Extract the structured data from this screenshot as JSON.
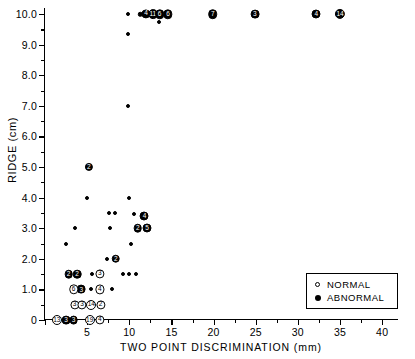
{
  "chart_data": {
    "type": "scatter",
    "title": "",
    "xlabel": "TWO POINT DISCRIMINATION  (mm)",
    "ylabel": "RIDGE (cm)",
    "xlim": [
      0,
      42
    ],
    "ylim": [
      0,
      10.2
    ],
    "grid": false,
    "legend_position": "lower-right",
    "x_ticks": [
      0,
      5,
      10,
      15,
      20,
      25,
      30,
      35,
      40
    ],
    "x_tick_labels": [
      "",
      "5",
      "10",
      "15",
      "20",
      "25",
      "30",
      "35",
      "40"
    ],
    "x_minor_ticks": [
      2.5,
      7.5,
      12.5,
      17.5,
      22.5,
      27.5,
      32.5,
      37.5
    ],
    "y_ticks": [
      0,
      1.0,
      2.0,
      3.0,
      4.0,
      5.0,
      6.0,
      7.0,
      8.0,
      9.0,
      10.0
    ],
    "y_tick_labels": [
      "0",
      "1.0",
      "2.0",
      "3.0",
      "4.0",
      "5.0",
      "6.0",
      "7.0",
      "8.0",
      "9.0",
      "10.0"
    ],
    "y_minor_ticks": [
      0.5,
      1.5,
      2.5,
      3.5,
      4.5,
      5.5,
      6.5,
      7.5,
      8.5,
      9.5
    ],
    "legend": [
      {
        "label": "NORMAL",
        "marker": "open-circle"
      },
      {
        "label": "ABNORMAL",
        "marker": "filled-circle"
      }
    ],
    "series": [
      {
        "name": "ABNORMAL",
        "marker": "filled-circle",
        "points": [
          {
            "x": 9.8,
            "y": 10.0,
            "n": 1,
            "r": 2.0
          },
          {
            "x": 9.8,
            "y": 9.35,
            "n": 1,
            "r": 2.0
          },
          {
            "x": 9.8,
            "y": 7.0,
            "n": 1,
            "r": 2.0
          },
          {
            "x": 11.3,
            "y": 10.0,
            "n": 1,
            "r": 2.2
          },
          {
            "x": 12.0,
            "y": 10.0,
            "n": 4,
            "r": 4.6
          },
          {
            "x": 12.8,
            "y": 10.0,
            "n": 11,
            "r": 4.9
          },
          {
            "x": 13.6,
            "y": 10.0,
            "n": 6,
            "r": 4.7
          },
          {
            "x": 13.5,
            "y": 9.75,
            "n": 1,
            "r": 2.0
          },
          {
            "x": 14.6,
            "y": 10.0,
            "n": 6,
            "r": 4.7
          },
          {
            "x": 19.9,
            "y": 10.0,
            "n": 7,
            "r": 4.8
          },
          {
            "x": 24.9,
            "y": 10.0,
            "n": 3,
            "r": 4.4
          },
          {
            "x": 32.2,
            "y": 10.0,
            "n": 4,
            "r": 4.5
          },
          {
            "x": 35.0,
            "y": 10.0,
            "n": 14,
            "r": 5.1
          },
          {
            "x": 5.2,
            "y": 5.0,
            "n": 2,
            "r": 4.1
          },
          {
            "x": 5.0,
            "y": 4.0,
            "n": 1,
            "r": 2.0
          },
          {
            "x": 10.0,
            "y": 4.0,
            "n": 1,
            "r": 2.0
          },
          {
            "x": 7.6,
            "y": 3.5,
            "n": 1,
            "r": 2.0
          },
          {
            "x": 8.3,
            "y": 3.5,
            "n": 1,
            "r": 2.0
          },
          {
            "x": 10.6,
            "y": 3.45,
            "n": 1,
            "r": 2.0
          },
          {
            "x": 11.8,
            "y": 3.4,
            "n": 4,
            "r": 4.5
          },
          {
            "x": 3.6,
            "y": 3.0,
            "n": 1,
            "r": 2.0
          },
          {
            "x": 7.7,
            "y": 3.0,
            "n": 1,
            "r": 2.0
          },
          {
            "x": 11.0,
            "y": 3.0,
            "n": 2,
            "r": 4.3
          },
          {
            "x": 12.1,
            "y": 3.0,
            "n": 5,
            "r": 4.5
          },
          {
            "x": 2.5,
            "y": 2.5,
            "n": 1,
            "r": 2.0
          },
          {
            "x": 10.2,
            "y": 2.5,
            "n": 1,
            "r": 2.0
          },
          {
            "x": 7.3,
            "y": 2.0,
            "n": 1,
            "r": 2.0
          },
          {
            "x": 8.4,
            "y": 2.0,
            "n": 2,
            "r": 4.3
          },
          {
            "x": 2.8,
            "y": 1.5,
            "n": 2,
            "r": 4.3
          },
          {
            "x": 3.8,
            "y": 1.5,
            "n": 2,
            "r": 4.3
          },
          {
            "x": 5.6,
            "y": 1.5,
            "n": 1,
            "r": 2.0
          },
          {
            "x": 9.2,
            "y": 1.5,
            "n": 1,
            "r": 2.0
          },
          {
            "x": 10.0,
            "y": 1.5,
            "n": 1,
            "r": 2.0
          },
          {
            "x": 10.8,
            "y": 1.5,
            "n": 1,
            "r": 2.0
          },
          {
            "x": 4.3,
            "y": 1.0,
            "n": 3,
            "r": 4.4
          },
          {
            "x": 5.5,
            "y": 1.0,
            "n": 1,
            "r": 2.0
          },
          {
            "x": 8.0,
            "y": 1.0,
            "n": 1,
            "r": 2.0
          },
          {
            "x": 2.5,
            "y": 0.0,
            "n": 3,
            "r": 4.4
          },
          {
            "x": 3.4,
            "y": 0.0,
            "n": 3,
            "r": 4.4
          }
        ]
      },
      {
        "name": "NORMAL",
        "marker": "open-circle",
        "points": [
          {
            "x": 6.5,
            "y": 1.5,
            "n": 3,
            "r": 4.6
          },
          {
            "x": 3.4,
            "y": 1.0,
            "n": 6,
            "r": 4.7
          },
          {
            "x": 6.5,
            "y": 1.0,
            "n": 4,
            "r": 4.6
          },
          {
            "x": 3.5,
            "y": 0.5,
            "n": 3,
            "r": 4.6
          },
          {
            "x": 4.4,
            "y": 0.5,
            "n": 3,
            "r": 4.6
          },
          {
            "x": 5.5,
            "y": 0.5,
            "n": 14,
            "r": 5.0
          },
          {
            "x": 6.6,
            "y": 0.5,
            "n": 2,
            "r": 4.6
          },
          {
            "x": 1.4,
            "y": 0.0,
            "n": 13,
            "r": 5.0
          },
          {
            "x": 5.3,
            "y": 0.0,
            "n": 19,
            "r": 5.0
          },
          {
            "x": 6.5,
            "y": 0.0,
            "n": 4,
            "r": 4.6
          }
        ]
      }
    ]
  }
}
